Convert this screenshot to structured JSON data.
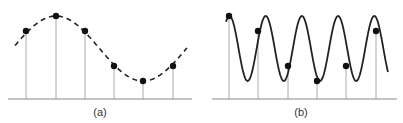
{
  "panels": [
    {
      "id": "a",
      "label": "(a)",
      "curve_style": "dashed",
      "baseline": {
        "x1": 8,
        "x2": 192,
        "y": 99
      },
      "samples": [
        {
          "x": 26,
          "y": 31
        },
        {
          "x": 56,
          "y": 16
        },
        {
          "x": 85,
          "y": 31
        },
        {
          "x": 114,
          "y": 66
        },
        {
          "x": 143,
          "y": 81
        },
        {
          "x": 173,
          "y": 66
        }
      ],
      "label_x": 100
    },
    {
      "id": "b",
      "label": "(b)",
      "curve_style": "solid",
      "baseline": {
        "x1": 212,
        "x2": 397,
        "y": 99
      },
      "samples": [
        {
          "x": 229,
          "y": 16
        },
        {
          "x": 258,
          "y": 31
        },
        {
          "x": 288,
          "y": 66
        },
        {
          "x": 317,
          "y": 81
        },
        {
          "x": 346,
          "y": 66
        },
        {
          "x": 376,
          "y": 31
        }
      ],
      "label_x": 301
    }
  ],
  "colors": {
    "curve": "#222222",
    "stem": "#aaaaaa",
    "baseline": "#888888",
    "dot": "#111111"
  }
}
